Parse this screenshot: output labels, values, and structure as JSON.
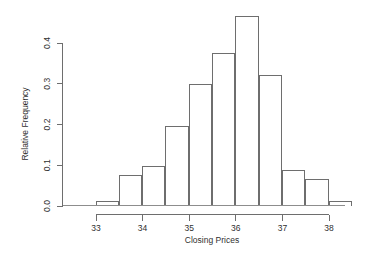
{
  "chart_data": {
    "type": "bar",
    "title": "",
    "xlabel": "Closing Prices",
    "ylabel": "Relative Frequency",
    "xlim": [
      32.75,
      38.75
    ],
    "ylim": [
      0.0,
      0.47
    ],
    "grid": false,
    "legend": null,
    "bin_width": 0.5,
    "bin_edges": [
      33.0,
      33.5,
      34.0,
      34.5,
      35.0,
      35.5,
      36.0,
      36.5,
      37.0,
      37.5,
      38.0,
      38.5
    ],
    "categories": [
      "33.0-33.5",
      "33.5-34.0",
      "34.0-34.5",
      "34.5-35.0",
      "35.0-35.5",
      "35.5-36.0",
      "36.0-36.5",
      "36.5-37.0",
      "37.0-37.5",
      "37.5-38.0",
      "38.0-38.5"
    ],
    "values": [
      0.012,
      0.076,
      0.098,
      0.194,
      0.299,
      0.374,
      0.465,
      0.32,
      0.088,
      0.066,
      0.012
    ],
    "xticks": [
      33,
      34,
      35,
      36,
      37,
      38
    ],
    "xticklabels": [
      "33",
      "34",
      "35",
      "36",
      "37",
      "38"
    ],
    "yticks": [
      0.0,
      0.1,
      0.2,
      0.3,
      0.4
    ],
    "yticklabels": [
      "0.0",
      "0.1",
      "0.2",
      "0.3",
      "0.4"
    ]
  },
  "style": {
    "axis_color": "#6e6e6e",
    "bar_stroke": "#6e6e6e",
    "bar_fill": "none",
    "text_color": "#2f2f2f",
    "background": "#ffffff"
  }
}
